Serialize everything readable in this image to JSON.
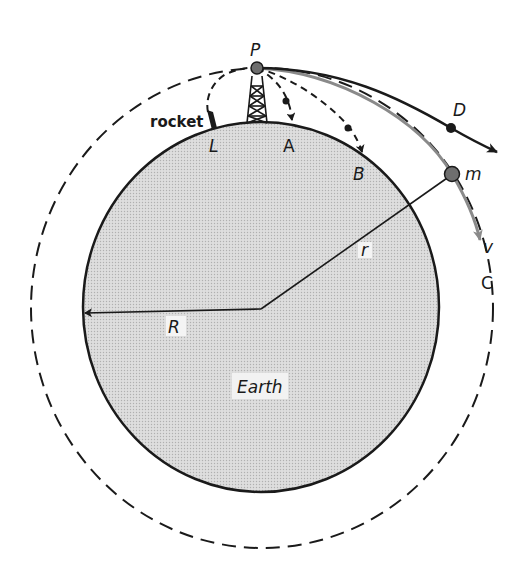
{
  "diagram": {
    "colors": {
      "earth_fill": "#d6d6d6",
      "stroke": "#1a1a1a",
      "orbit_gray": "#8a8a8a",
      "dot_fill": "#6e6e6e",
      "background": "#ffffff"
    },
    "labels": {
      "P": "P",
      "rocket": "rocket",
      "L": "L",
      "A": "A",
      "B": "B",
      "D": "D",
      "m": "m",
      "v": "v",
      "C": "C",
      "r": "r",
      "R": "R",
      "earth": "Earth"
    },
    "elements": [
      {
        "id": "earth",
        "type": "ellipse",
        "label": "Earth"
      },
      {
        "id": "orbit-C",
        "type": "dashed-circle",
        "label": "C"
      },
      {
        "id": "launch-point",
        "type": "dot",
        "label": "P"
      },
      {
        "id": "tower",
        "type": "lattice-tower"
      },
      {
        "id": "rocket-path",
        "type": "dashed-curve",
        "from": "L",
        "to": "P",
        "label": "rocket"
      },
      {
        "id": "trajectory-A",
        "type": "dashed-curve",
        "from": "P",
        "to": "A"
      },
      {
        "id": "trajectory-B",
        "type": "dashed-curve",
        "from": "P",
        "to": "B"
      },
      {
        "id": "trajectory-D",
        "type": "solid-curve",
        "from": "P",
        "to": "D",
        "note": "escape trajectory"
      },
      {
        "id": "orbit-path",
        "type": "gray-curve",
        "from": "P",
        "through": "m",
        "label": "v"
      },
      {
        "id": "radius-r",
        "type": "line",
        "from": "center",
        "to": "m",
        "label": "r"
      },
      {
        "id": "radius-R",
        "type": "arrow",
        "from": "center",
        "to": "earth-edge",
        "label": "R"
      }
    ]
  }
}
